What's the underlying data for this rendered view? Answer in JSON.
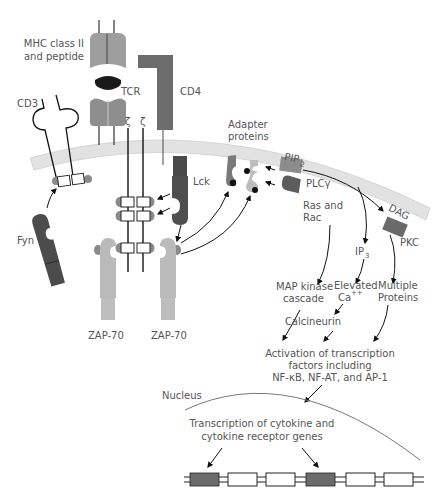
{
  "colors": {
    "membrane": "#e0e0e0",
    "membrane_edge": "#c8c8c8",
    "mhc": "#9a9a9a",
    "tcr": "#8c8c8c",
    "cd4": "#6e6e6e",
    "lck": "#4e4e4e",
    "fyn": "#4e4e4e",
    "zap70": "#b8b8b8",
    "adapter_dark": "#7a7a7a",
    "adapter_light": "#bdbdbd",
    "plc": "#8a8a8a",
    "ras": "#5c5c5c",
    "pkc": "#6a6a6a",
    "itam_cap": "#8a8a8a",
    "gene_exon": "#6c6c6c",
    "line": "#111111",
    "text": "#555555"
  },
  "labels": {
    "mhc_line1": "MHC class II",
    "mhc_line2": "and peptide",
    "tcr": "TCR",
    "cd4": "CD4",
    "cd3": "CD3",
    "zeta1": "ζ",
    "zeta2": "ζ",
    "lck": "Lck",
    "fyn": "Fyn",
    "zap70_left": "ZAP-70",
    "zap70_right": "ZAP-70",
    "adapter_line1": "Adapter",
    "adapter_line2": "proteins",
    "pip2": "PIP",
    "pip2_sub": "2",
    "plc": "PLCγ",
    "ras_line1": "Ras and",
    "ras_line2": "Rac",
    "dag": "DAG",
    "pkc": "PKC",
    "ip3": "IP",
    "ip3_sub": "3",
    "map_line1": "MAP kinase",
    "map_line2": "cascade",
    "ca_line1": "Elevated",
    "ca_line2": "Ca",
    "ca_sup": "++",
    "multi_line1": "Multiple",
    "multi_line2": "Proteins",
    "calcineurin": "Calcineurin",
    "activation_line1": "Activation of transcription",
    "activation_line2": "factors including",
    "activation_line3": "NF-κB, NF-AT, and AP-1",
    "nucleus": "Nucleus",
    "transcription_line1": "Transcription of cytokine and",
    "transcription_line2": "cytokine receptor genes"
  },
  "gene_segments": [
    {
      "type": "exon-shaded"
    },
    {
      "type": "exon-open"
    },
    {
      "type": "exon-open"
    },
    {
      "type": "exon-shaded"
    },
    {
      "type": "exon-open"
    },
    {
      "type": "exon-open"
    }
  ]
}
